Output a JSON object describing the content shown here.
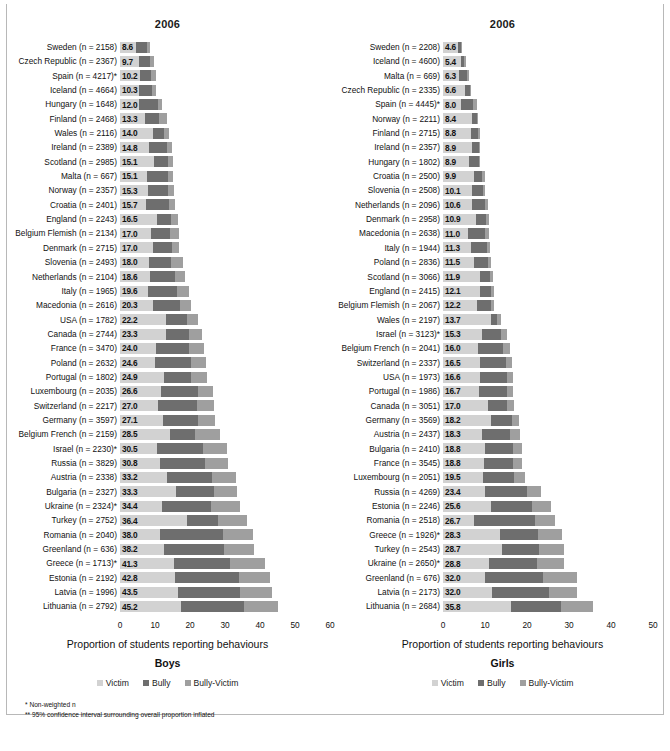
{
  "figure": {
    "background": "#ffffff",
    "colors": {
      "victim": "#d2d2d2",
      "bully": "#6e6e6e",
      "bully_victim": "#9f9f9f"
    },
    "footnotes": [
      "* Non-weighted n",
      "** 95% confidence interval surrounding overall proportion inflated"
    ]
  },
  "chart_data": [
    {
      "type": "bar",
      "orientation": "horizontal",
      "stacked": true,
      "title": "2006",
      "panel_title": "Boys",
      "xlabel": "Proportion of students reporting behaviours",
      "ylabel": "",
      "xlim": [
        0,
        60
      ],
      "xticks": [
        0,
        10,
        20,
        30,
        40,
        50,
        60
      ],
      "grid": false,
      "legend": [
        "Victim",
        "Bully",
        "Bully-Victim"
      ],
      "legend_position": "bottom",
      "series_names": [
        "Victim",
        "Bully",
        "Bully-Victim"
      ],
      "categories": [
        "Sweden (n = 2158)",
        "Czech Republic (n = 2367)",
        "Spain (n = 4217)*",
        "Iceland (n = 4664)",
        "Hungary (n = 1648)",
        "Finland (n = 2468)",
        "Wales (n = 2116)",
        "Ireland (n = 2389)",
        "Scotland (n = 2985)",
        "Malta (n = 667)",
        "Norway (n = 2357)",
        "Croatia (n = 2401)",
        "England (n = 2243)",
        "Belgium Flemish (n = 2134)",
        "Denmark (n = 2715)",
        "Slovenia (n = 2493)",
        "Netherlands (n = 2104)",
        "Italy (n = 1965)",
        "Macedonia (n = 2616)",
        "USA (n = 1782)",
        "Canada (n = 2744)",
        "France (n = 3470)",
        "Poland (n = 2632)",
        "Portugal (n = 1802)",
        "Luxembourg (n = 2035)",
        "Switzerland (n = 2217)",
        "Germany (n = 3597)",
        "Belgium French (n = 2159)",
        "Israel (n = 2230)*",
        "Russia (n = 3829)",
        "Austria (n = 2338)",
        "Bulgaria (n = 2327)",
        "Ukraine (n = 2324)*",
        "Turkey (n = 2752)",
        "Romania (n = 2040)",
        "Greenland (n = 636)",
        "Greece (n = 1713)*",
        "Estonia (n = 2192)",
        "Latvia (n = 1996)",
        "Lithuania (n = 2792)"
      ],
      "totals": [
        8.6,
        9.7,
        10.2,
        10.3,
        12.0,
        13.3,
        14.0,
        14.8,
        15.1,
        15.1,
        15.3,
        15.7,
        16.5,
        17.0,
        17.0,
        18.0,
        18.6,
        19.6,
        20.3,
        22.2,
        23.3,
        24.0,
        24.6,
        24.9,
        26.6,
        27.0,
        27.1,
        28.5,
        30.5,
        30.8,
        33.2,
        33.3,
        34.4,
        36.4,
        38.0,
        38.2,
        41.3,
        42.8,
        43.5,
        45.2
      ],
      "totals_labels": [
        "8.6",
        "9.7",
        "10.2",
        "10.3",
        "12.0",
        "13.3",
        "14.0",
        "14.8",
        "15.1",
        "15.1",
        "15.3",
        "15.7",
        "16.5",
        "17.0",
        "17.0",
        "18.0",
        "18.6",
        "19.6",
        "20.3",
        "22.2",
        "23.3",
        "24.0",
        "24.6",
        "24.9",
        "26.6",
        "27.0",
        "27.1",
        "28.5",
        "30.5",
        "30.8",
        "33.2",
        "33.3",
        "34.4",
        "36.4",
        "38.0",
        "38.2",
        "41.3",
        "42.8",
        "43.5",
        "45.2"
      ],
      "series": [
        {
          "name": "Victim",
          "values": [
            4.5,
            5.3,
            5.6,
            5.5,
            5.3,
            7.0,
            9.3,
            8.2,
            9.6,
            7.6,
            8.0,
            7.4,
            10.5,
            8.9,
            9.5,
            8.2,
            8.5,
            8.1,
            9.5,
            13.2,
            13.1,
            10.3,
            10.1,
            12.5,
            11.8,
            10.8,
            12.3,
            14.2,
            10.7,
            11.3,
            13.4,
            16.1,
            12.1,
            19.0,
            11.5,
            12.6,
            15.4,
            15.6,
            16.5,
            17.4
          ]
        },
        {
          "name": "Bully",
          "values": [
            3.2,
            3.4,
            3.3,
            3.7,
            5.6,
            4.2,
            3.4,
            5.2,
            4.0,
            6.0,
            5.7,
            6.6,
            4.0,
            5.5,
            5.4,
            6.3,
            7.1,
            8.1,
            7.5,
            6.0,
            6.6,
            9.3,
            10.2,
            7.7,
            10.4,
            11.2,
            10.0,
            7.1,
            13.0,
            13.0,
            13.0,
            10.9,
            13.9,
            9.1,
            17.8,
            17.1,
            16.0,
            18.5,
            17.9,
            18.0
          ]
        },
        {
          "name": "Bully-Victim",
          "values": [
            0.9,
            1.0,
            1.3,
            1.1,
            1.1,
            2.1,
            1.3,
            1.4,
            1.5,
            1.5,
            1.6,
            1.7,
            2.0,
            2.6,
            2.1,
            3.5,
            3.0,
            3.4,
            3.3,
            3.0,
            3.6,
            4.4,
            4.3,
            4.7,
            4.4,
            5.0,
            4.8,
            7.2,
            6.8,
            6.5,
            6.8,
            6.3,
            8.4,
            8.3,
            8.7,
            8.5,
            9.9,
            8.7,
            9.1,
            9.8
          ]
        }
      ]
    },
    {
      "type": "bar",
      "orientation": "horizontal",
      "stacked": true,
      "title": "2006",
      "panel_title": "Girls",
      "xlabel": "Proportion of students reporting behaviours",
      "ylabel": "",
      "xlim": [
        0,
        50
      ],
      "xticks": [
        0,
        10,
        20,
        30,
        40,
        50
      ],
      "grid": false,
      "legend": [
        "Victim",
        "Bully",
        "Bully-Victim"
      ],
      "legend_position": "bottom",
      "series_names": [
        "Victim",
        "Bully",
        "Bully-Victim"
      ],
      "categories": [
        "Sweden (n = 2208)",
        "Iceland (n = 4600)",
        "Malta (n = 669)",
        "Czech Republic (n = 2335)",
        "Spain (n = 4445)*",
        "Norway (n = 2211)",
        "Finland (n = 2715)",
        "Ireland (n = 2357)",
        "Hungary (n = 1802)",
        "Croatia (n = 2500)",
        "Slovenia (n = 2508)",
        "Netherlands (n = 2096)",
        "Denmark (n = 2958)",
        "Macedonia (n = 2638)",
        "Italy (n = 1944)",
        "Poland (n = 2836)",
        "Scotland (n = 3066)",
        "England (n = 2415)",
        "Belgium Flemish (n = 2067)",
        "Wales (n = 2197)",
        "Israel (n = 3123)*",
        "Belgium French (n = 2041)",
        "Switzerland (n = 2337)",
        "USA (n = 1973)",
        "Portugal (n = 1986)",
        "Canada (n = 3051)",
        "Germany (n = 3569)",
        "Austria (n = 2437)",
        "Bulgaria (n = 2410)",
        "France (n = 3545)",
        "Luxembourg (n = 2051)",
        "Russia (n = 4269)",
        "Estonia (n = 2246)",
        "Romania (n = 2518)",
        "Greece (n = 1926)*",
        "Turkey (n = 2543)",
        "Ukraine (n = 2650)*",
        "Greenland (n = 676)",
        "Latvia (n = 2173)",
        "Lithuania (n = 2684)"
      ],
      "totals": [
        4.6,
        5.4,
        6.3,
        6.6,
        8.0,
        8.4,
        8.8,
        8.9,
        8.9,
        9.9,
        10.1,
        10.6,
        10.9,
        11.0,
        11.3,
        11.5,
        11.9,
        12.1,
        12.2,
        13.7,
        15.3,
        16.0,
        16.5,
        16.6,
        16.7,
        17.0,
        18.2,
        18.3,
        18.8,
        18.8,
        19.5,
        23.4,
        25.6,
        26.7,
        28.3,
        28.7,
        28.8,
        32.0,
        32.0,
        35.8
      ],
      "totals_labels": [
        "4.6",
        "5.4",
        "6.3",
        "6.6",
        "8.0",
        "8.4",
        "8.8",
        "8.9",
        "8.9",
        "9.9",
        "10.1",
        "10.6",
        "10.9",
        "11.0",
        "11.3",
        "11.5",
        "11.9",
        "12.1",
        "12.2",
        "13.7",
        "15.3",
        "16.0",
        "16.5",
        "16.6",
        "16.7",
        "17.0",
        "18.2",
        "18.3",
        "18.8",
        "18.8",
        "19.5",
        "23.4",
        "25.6",
        "26.7",
        "28.3",
        "28.7",
        "28.8",
        "32.0",
        "32.0",
        "35.8"
      ],
      "series": [
        {
          "name": "Victim",
          "values": [
            3.6,
            4.4,
            3.9,
            5.3,
            4.4,
            6.9,
            6.7,
            6.8,
            6.3,
            7.4,
            6.9,
            6.9,
            7.9,
            5.9,
            6.6,
            7.3,
            8.8,
            8.7,
            8.2,
            11.4,
            9.3,
            8.3,
            8.9,
            8.9,
            8.6,
            10.7,
            11.4,
            9.4,
            9.9,
            9.8,
            9.5,
            10.0,
            11.4,
            7.3,
            13.6,
            14.0,
            10.9,
            9.9,
            11.7,
            16.1
          ]
        },
        {
          "name": "Bully",
          "values": [
            0.8,
            0.7,
            1.9,
            1.1,
            2.7,
            1.2,
            1.7,
            1.7,
            2.2,
            2.0,
            2.6,
            3.1,
            2.4,
            4.1,
            3.8,
            3.4,
            2.5,
            2.8,
            3.2,
            1.5,
            4.6,
            6.1,
            6.2,
            6.3,
            6.6,
            4.5,
            5.0,
            6.6,
            6.7,
            6.9,
            7.4,
            9.9,
            9.7,
            14.7,
            9.1,
            8.8,
            11.4,
            13.8,
            13.6,
            12.0
          ]
        },
        {
          "name": "Bully-Victim",
          "values": [
            0.2,
            0.3,
            0.5,
            0.2,
            0.9,
            0.3,
            0.4,
            0.4,
            0.4,
            0.5,
            0.6,
            0.6,
            0.6,
            1.0,
            0.9,
            0.8,
            0.6,
            0.6,
            0.8,
            0.8,
            1.4,
            1.6,
            1.4,
            1.4,
            1.5,
            1.8,
            1.8,
            2.3,
            2.2,
            2.1,
            2.6,
            3.5,
            4.5,
            4.7,
            5.6,
            5.9,
            6.5,
            8.3,
            6.7,
            7.7
          ]
        }
      ]
    }
  ]
}
